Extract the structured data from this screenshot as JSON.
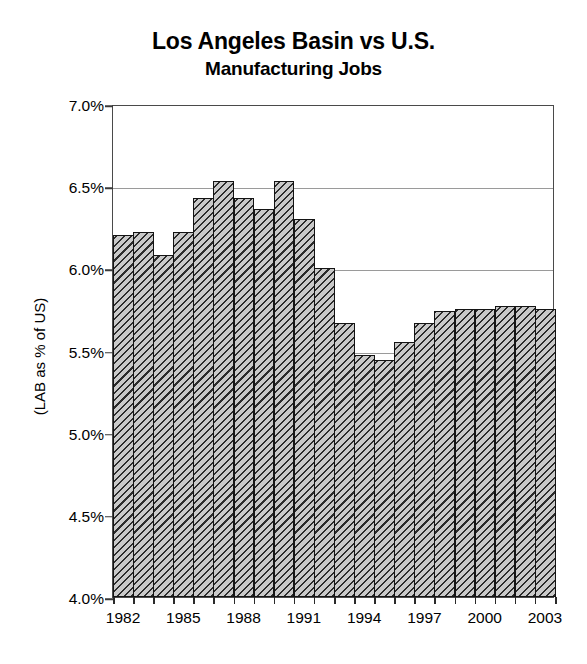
{
  "chart_data": {
    "type": "bar",
    "title": "Los Angeles Basin vs U.S.",
    "subtitle": "Manufacturing Jobs",
    "xlabel": "",
    "ylabel": "(LAB as % of US)",
    "ylim": [
      4.0,
      7.0
    ],
    "ytick_step": 0.5,
    "grid": true,
    "legend": "none",
    "yticks": [
      "7.0%",
      "6.5%",
      "6.0%",
      "5.5%",
      "5.0%",
      "4.5%",
      "4.0%"
    ],
    "ytick_values": [
      7.0,
      6.5,
      6.0,
      5.5,
      5.0,
      4.5,
      4.0
    ],
    "xticks": [
      "1982",
      "1985",
      "1988",
      "1991",
      "1994",
      "1997",
      "2000",
      "2003"
    ],
    "xtick_values": [
      1982,
      1985,
      1988,
      1991,
      1994,
      1997,
      2000,
      2003
    ],
    "categories": [
      "1982",
      "1983",
      "1984",
      "1985",
      "1986",
      "1987",
      "1988",
      "1989",
      "1990",
      "1991",
      "1992",
      "1993",
      "1994",
      "1995",
      "1996",
      "1997",
      "1998",
      "1999",
      "2000",
      "2001",
      "2002",
      "2003"
    ],
    "values": [
      6.2,
      6.22,
      6.08,
      6.22,
      6.43,
      6.53,
      6.43,
      6.36,
      6.53,
      6.3,
      6.0,
      5.67,
      5.47,
      5.44,
      5.55,
      5.67,
      5.74,
      5.75,
      5.75,
      5.77,
      5.77,
      5.75
    ],
    "series": [
      {
        "name": "LAB as % of US",
        "values": [
          6.2,
          6.22,
          6.08,
          6.22,
          6.43,
          6.53,
          6.43,
          6.36,
          6.53,
          6.3,
          6.0,
          5.67,
          5.47,
          5.44,
          5.55,
          5.67,
          5.74,
          5.75,
          5.75,
          5.77,
          5.77,
          5.75
        ]
      }
    ],
    "bar_fill": "#c9c9c9",
    "bar_edge": "#141414",
    "bar_hatch": "diagonal-lines",
    "gridline_color": "#9a9a9a",
    "axis_color": "#4a4a4a",
    "background": "#ffffff"
  }
}
